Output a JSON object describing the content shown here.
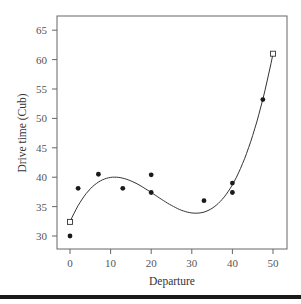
{
  "chart_data": {
    "type": "scatter",
    "title": "",
    "xlabel": "Departure",
    "ylabel": "Drive time (Cub)",
    "xlim": [
      -3,
      53
    ],
    "ylim": [
      27.8,
      67.3
    ],
    "xticks": [
      0,
      10,
      20,
      30,
      40,
      50
    ],
    "yticks": [
      30,
      35,
      40,
      45,
      50,
      55,
      60,
      65
    ],
    "grid": false,
    "legend": null,
    "series": [
      {
        "name": "observed",
        "marker": "filled-circle",
        "points": [
          {
            "x": 0,
            "y": 30.0
          },
          {
            "x": 2,
            "y": 38.1
          },
          {
            "x": 7,
            "y": 40.5
          },
          {
            "x": 13,
            "y": 38.1
          },
          {
            "x": 20,
            "y": 40.4
          },
          {
            "x": 20,
            "y": 37.4
          },
          {
            "x": 33,
            "y": 36.0
          },
          {
            "x": 40,
            "y": 39.0
          },
          {
            "x": 40,
            "y": 37.4
          },
          {
            "x": 47.5,
            "y": 53.2
          }
        ]
      },
      {
        "name": "endpoints",
        "marker": "open-square",
        "points": [
          {
            "x": 0,
            "y": 32.4
          },
          {
            "x": 50,
            "y": 61.0
          }
        ]
      },
      {
        "name": "fitted-curve",
        "type": "line",
        "description": "cubic fit through endpoints, local max near x=11, local min near x=31",
        "coefficients": [
          32.4,
          1.5688,
          -0.09661,
          0.0015335
        ],
        "x_range": [
          0,
          50
        ]
      }
    ]
  }
}
